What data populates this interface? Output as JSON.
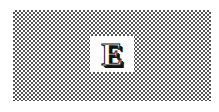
{
  "background": {
    "pattern": "checkerboard-dither",
    "color": "#555555"
  },
  "logo": {
    "letter": "E",
    "icon": "letter-e-logo-icon"
  }
}
